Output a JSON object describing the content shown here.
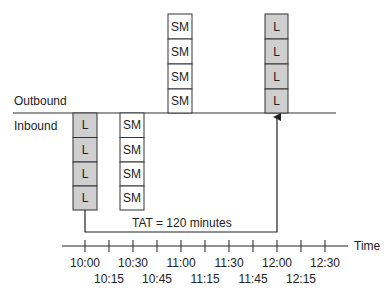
{
  "labels": {
    "outbound": "Outbound",
    "inbound": "Inbound",
    "tat": "TAT = 120 minutes",
    "axis": "Time"
  },
  "colors": {
    "large_fill": "#cfcfcf",
    "small_fill": "#ffffff",
    "stroke": "#333333"
  },
  "stacks": [
    {
      "side": "inbound",
      "time": "10:00",
      "items": [
        "L",
        "L",
        "L",
        "L"
      ],
      "type": "large"
    },
    {
      "side": "inbound",
      "time": "10:30",
      "items": [
        "SM",
        "SM",
        "SM",
        "SM"
      ],
      "type": "small"
    },
    {
      "side": "outbound",
      "time": "11:00",
      "items": [
        "SM",
        "SM",
        "SM",
        "SM"
      ],
      "type": "small"
    },
    {
      "side": "outbound",
      "time": "12:00",
      "items": [
        "L",
        "L",
        "L",
        "L"
      ],
      "type": "large"
    }
  ],
  "timeline": {
    "upper_labels": [
      "10:00",
      "10:30",
      "11:00",
      "11:30",
      "12:00",
      "12:30"
    ],
    "lower_labels": [
      "10:15",
      "10:45",
      "11:15",
      "11:45",
      "12:15"
    ]
  }
}
